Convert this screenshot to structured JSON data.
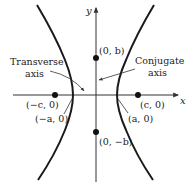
{
  "diagram": {
    "type": "hyperbola",
    "colors": {
      "curve": "#1a1a1a",
      "axis": "#333333",
      "text": "#222222",
      "background": "#ffffff"
    },
    "axes": {
      "x_label": "x",
      "y_label": "y"
    },
    "points": {
      "neg_focus": {
        "label": "(−c, 0)"
      },
      "pos_focus": {
        "label": "(c, 0)"
      },
      "neg_vertex": {
        "label": "(−a, 0)"
      },
      "pos_vertex": {
        "label": "(a, 0)"
      },
      "pos_covertex": {
        "label": "(0, b)"
      },
      "neg_covertex": {
        "label": "(0, −b)"
      }
    },
    "annotations": {
      "transverse": {
        "line1": "Transverse",
        "line2": "axis"
      },
      "conjugate": {
        "line1": "Conjugate",
        "line2": "axis"
      }
    }
  }
}
